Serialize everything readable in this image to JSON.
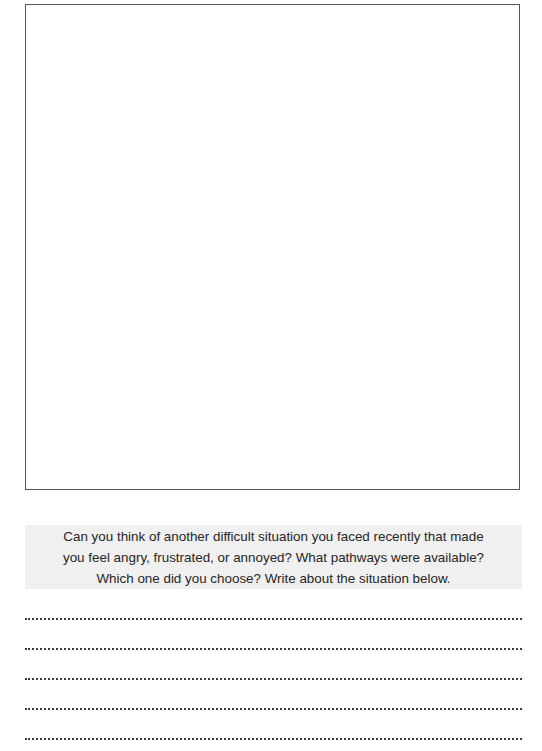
{
  "drawing_area": {
    "label": ""
  },
  "prompt": {
    "text": "Can you think of another difficult situation you faced recently that made you feel angry, frustrated, or annoyed? What pathways were available? Which one did you choose? Write about the situation below.",
    "lines": [
      "Can you think of another difficult situation you faced recently that made",
      "you feel angry, frustrated, or annoyed? What pathways were available?",
      "Which one did you choose? Write about the situation below."
    ]
  },
  "writing_lines": {
    "count": 5,
    "values": [
      "",
      "",
      "",
      "",
      ""
    ]
  },
  "colors": {
    "box_border": "#555555",
    "band_background": "#f0f0f0",
    "text": "#262626",
    "dots": "#3a3a3a"
  }
}
